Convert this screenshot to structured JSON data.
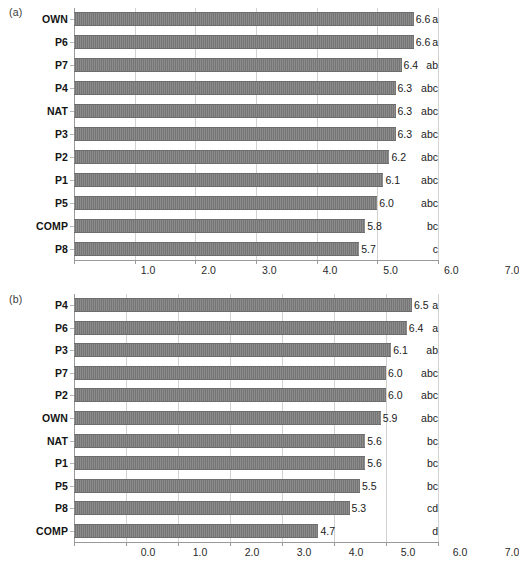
{
  "figure": {
    "background": "#ffffff",
    "bar_color": "#7b7b7b",
    "grid_color": "#d2d2d2",
    "axis_color": "#9a9a9a",
    "caption_partial": ""
  },
  "chart_data": [
    {
      "type": "bar",
      "orientation": "horizontal",
      "panel": "(a)",
      "title": "",
      "xlabel": "",
      "ylabel": "",
      "xlim": [
        1.0,
        7.0
      ],
      "xticks": [
        "1.0",
        "2.0",
        "3.0",
        "4.0",
        "5.0",
        "6.0",
        "7.0"
      ],
      "xtick_values": [
        1.0,
        2.0,
        3.0,
        4.0,
        5.0,
        6.0,
        7.0
      ],
      "grid": true,
      "legend": "none",
      "categories": [
        "OWN",
        "P6",
        "P7",
        "P4",
        "NAT",
        "P3",
        "P2",
        "P1",
        "P5",
        "COMP",
        "P8"
      ],
      "values": [
        6.6,
        6.6,
        6.4,
        6.3,
        6.3,
        6.3,
        6.2,
        6.1,
        6.0,
        5.8,
        5.7
      ],
      "value_labels": [
        "6.6",
        "6.6",
        "6.4",
        "6.3",
        "6.3",
        "6.3",
        "6.2",
        "6.1",
        "6.0",
        "5.8",
        "5.7"
      ],
      "group_labels": [
        "a",
        "a",
        "ab",
        "abc",
        "abc",
        "abc",
        "abc",
        "abc",
        "abc",
        "bc",
        "c"
      ]
    },
    {
      "type": "bar",
      "orientation": "horizontal",
      "panel": "(b)",
      "title": "",
      "xlabel": "",
      "ylabel": "",
      "xlim": [
        0.0,
        7.0
      ],
      "xticks": [
        "0.0",
        "1.0",
        "2.0",
        "3.0",
        "4.0",
        "5.0",
        "6.0",
        "7.0"
      ],
      "xtick_values": [
        0.0,
        1.0,
        2.0,
        3.0,
        4.0,
        5.0,
        6.0,
        7.0
      ],
      "grid": true,
      "legend": "none",
      "categories": [
        "P4",
        "P6",
        "P3",
        "P7",
        "P2",
        "OWN",
        "NAT",
        "P1",
        "P5",
        "P8",
        "COMP"
      ],
      "values": [
        6.5,
        6.4,
        6.1,
        6.0,
        6.0,
        5.9,
        5.6,
        5.6,
        5.5,
        5.3,
        4.7
      ],
      "value_labels": [
        "6.5",
        "6.4",
        "6.1",
        "6.0",
        "6.0",
        "5.9",
        "5.6",
        "5.6",
        "5.5",
        "5.3",
        "4.7"
      ],
      "group_labels": [
        "a",
        "a",
        "ab",
        "abc",
        "abc",
        "abc",
        "bc",
        "bc",
        "bc",
        "cd",
        "d"
      ]
    }
  ]
}
